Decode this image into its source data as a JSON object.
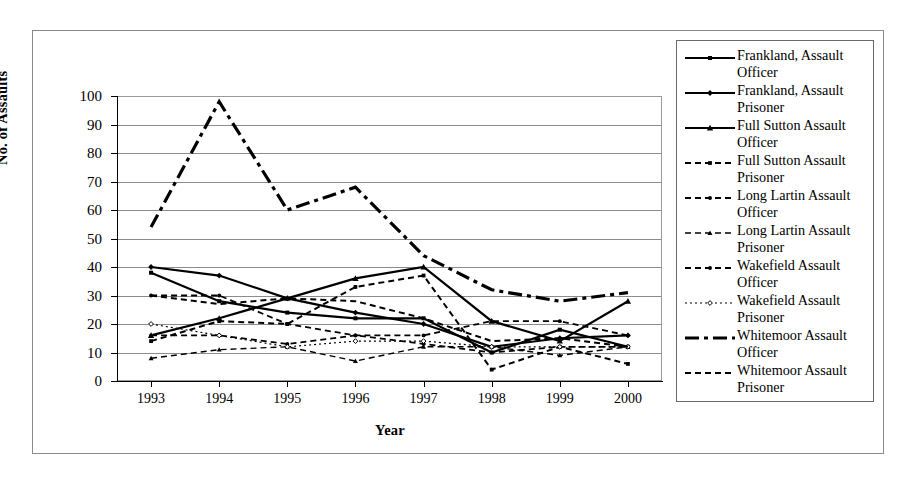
{
  "chart_data": {
    "type": "line",
    "title": "",
    "xlabel": "Year",
    "ylabel": "No. of Assaults",
    "categories": [
      "1993",
      "1994",
      "1995",
      "1996",
      "1997",
      "1998",
      "1999",
      "2000"
    ],
    "x": [
      1993,
      1994,
      1995,
      1996,
      1997,
      1998,
      1999,
      2000
    ],
    "ylim": [
      0,
      100
    ],
    "ytick_labels": [
      "0",
      "10",
      "20",
      "30",
      "40",
      "50",
      "60",
      "70",
      "80",
      "90",
      "100"
    ],
    "ytick_values": [
      0,
      10,
      20,
      30,
      40,
      50,
      60,
      70,
      80,
      90,
      100
    ],
    "grid": "horizontal",
    "legend_position": "right",
    "series": [
      {
        "name": "Frankland, Assault Officer",
        "label_line1": "Frankland, Assault",
        "label_line2": "Officer",
        "marker": "square",
        "dash": "solid",
        "width": 2.2,
        "values": [
          38,
          28,
          24,
          22,
          22,
          10,
          18,
          12
        ]
      },
      {
        "name": "Frankland, Assault Prisoner",
        "label_line1": "Frankland, Assault",
        "label_line2": "Prisoner",
        "marker": "diamond",
        "dash": "solid",
        "width": 2.2,
        "values": [
          40,
          37,
          29,
          24,
          20,
          12,
          15,
          16
        ]
      },
      {
        "name": "Full Sutton Assault Officer",
        "label_line1": "Full Sutton Assault",
        "label_line2": "Officer",
        "marker": "triangle",
        "dash": "solid",
        "width": 2.2,
        "values": [
          16,
          22,
          29,
          36,
          40,
          21,
          14,
          28
        ]
      },
      {
        "name": "Full Sutton Assault Prisoner",
        "label_line1": "Full Sutton Assault",
        "label_line2": "Prisoner",
        "marker": "square",
        "dash": "dashed",
        "width": 2.0,
        "values": [
          14,
          21,
          20,
          33,
          37,
          4,
          12,
          6
        ]
      },
      {
        "name": "Long Lartin Assault Officer",
        "label_line1": "Long Lartin Assault",
        "label_line2": "Officer",
        "marker": "circle",
        "dash": "dashed",
        "width": 1.8,
        "values": [
          16,
          16,
          13,
          16,
          13,
          10,
          12,
          12
        ]
      },
      {
        "name": "Long Lartin Assault Prisoner",
        "label_line1": "Long Lartin Assault",
        "label_line2": "Prisoner",
        "marker": "triangle",
        "dash": "dashed",
        "width": 1.4,
        "values": [
          8,
          11,
          12,
          7,
          12,
          12,
          9,
          12
        ]
      },
      {
        "name": "Wakefield Assault Officer",
        "label_line1": "Wakefield Assault",
        "label_line2": "Officer",
        "marker": "circle",
        "dash": "dashed",
        "width": 1.8,
        "values": [
          30,
          30,
          20,
          16,
          16,
          21,
          21,
          16
        ]
      },
      {
        "name": "Wakefield Assault Prisoner",
        "label_line1": "Wakefield Assault",
        "label_line2": "Prisoner",
        "marker": "open-diamond",
        "dash": "dotted",
        "width": 1.2,
        "values": [
          20,
          16,
          12,
          14,
          14,
          12,
          12,
          12
        ]
      },
      {
        "name": "Whitemoor Assault Officer",
        "label_line1": "Whitemoor Assault",
        "label_line2": "Officer",
        "marker": "none",
        "dash": "dashdot",
        "width": 3.2,
        "values": [
          54,
          98,
          60,
          68,
          44,
          32,
          28,
          31
        ]
      },
      {
        "name": "Whitemoor Assault Prisoner",
        "label_line1": "Whitemoor Assault",
        "label_line2": "Prisoner",
        "marker": "none",
        "dash": "dashed",
        "width": 2.0,
        "values": [
          30,
          27,
          29,
          28,
          22,
          14,
          15,
          12
        ]
      }
    ]
  },
  "axes": {
    "y_title": "No. of Assaults",
    "x_title": "Year"
  },
  "legend": {
    "items": [
      {
        "line1": "Frankland, Assault",
        "line2": "Officer"
      },
      {
        "line1": "Frankland, Assault",
        "line2": "Prisoner"
      },
      {
        "line1": "Full Sutton Assault",
        "line2": "Officer"
      },
      {
        "line1": "Full Sutton Assault",
        "line2": "Prisoner"
      },
      {
        "line1": "Long Lartin Assault",
        "line2": "Officer"
      },
      {
        "line1": "Long Lartin Assault",
        "line2": "Prisoner"
      },
      {
        "line1": "Wakefield Assault",
        "line2": "Officer"
      },
      {
        "line1": "Wakefield Assault",
        "line2": "Prisoner"
      },
      {
        "line1": "Whitemoor Assault",
        "line2": "Officer"
      },
      {
        "line1": "Whitemoor Assault",
        "line2": "Prisoner"
      }
    ]
  },
  "colors": {
    "ink": "#000000",
    "grid": "#8c8c8c",
    "frame": "#8a8a8a",
    "background": "#ffffff"
  }
}
